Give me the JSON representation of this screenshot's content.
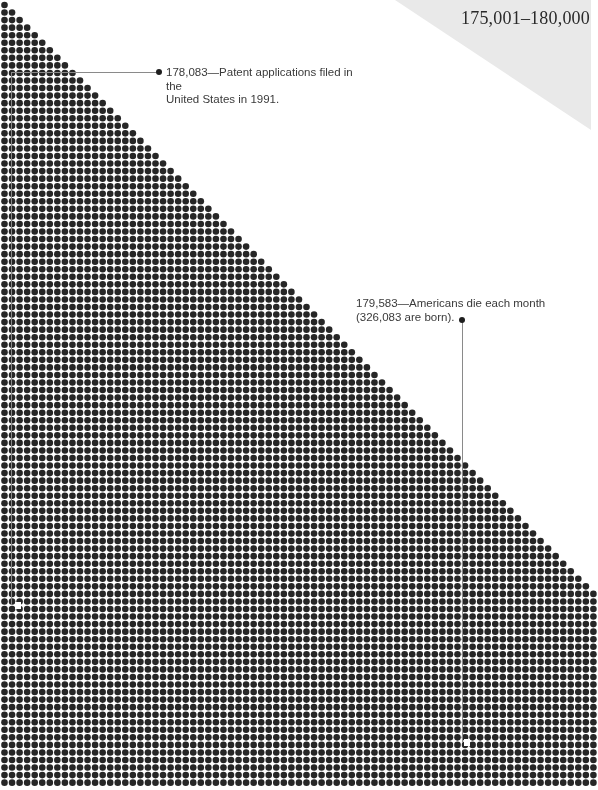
{
  "page": {
    "range_title": "175,001–180,000"
  },
  "annotations": [
    {
      "value": "178,083",
      "line1": "178,083—Patent applications filed in the",
      "line2": "United States in 1991."
    },
    {
      "value": "179,583",
      "line1": "179,583—Americans die each month",
      "line2": "(326,083 are born)."
    }
  ],
  "colors": {
    "dot": "#262626",
    "background": "#ffffff",
    "corner_gray": "#e9e9e9",
    "leader": "#8a8a8a",
    "text": "#3a3a3a"
  },
  "chart_data": {
    "type": "dot-matrix",
    "title": "175,001–180,000",
    "range_start": 175001,
    "range_end": 180000,
    "grid": {
      "pitch_px": 7.55,
      "dot_diameter_px": 6.6,
      "origin_x": 4.5,
      "origin_y": 5,
      "max_columns": 79,
      "triangle_rows": 79,
      "total_rows": 104
    },
    "highlighted_points": [
      {
        "value": 178083,
        "label": "Patent applications filed in the United States in 1991."
      },
      {
        "value": 179583,
        "label": "Americans die each month (326,083 are born)."
      }
    ],
    "xlabel": "",
    "ylabel": "",
    "legend": null
  }
}
